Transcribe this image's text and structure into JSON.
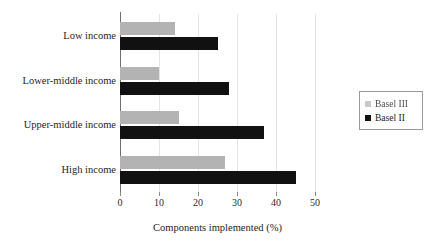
{
  "chart_data": {
    "type": "bar",
    "orientation": "horizontal",
    "title": "",
    "xlabel": "Components implemented (%)",
    "ylabel": "",
    "xlim": [
      0,
      50
    ],
    "xticks": [
      0,
      10,
      20,
      30,
      40,
      50
    ],
    "grid": "vertical",
    "legend_position": "right",
    "categories": [
      "Low income",
      "Lower-middle income",
      "Upper-middle income",
      "High income"
    ],
    "series": [
      {
        "name": "Basel III",
        "color": "#b3b3b3",
        "values": [
          14,
          10,
          15,
          27
        ]
      },
      {
        "name": "Basel II",
        "color": "#111111",
        "values": [
          25,
          28,
          37,
          45
        ]
      }
    ]
  },
  "legend": {
    "items": [
      {
        "label": "Basel III",
        "color": "#b3b3b3"
      },
      {
        "label": "Basel II",
        "color": "#111111"
      }
    ]
  }
}
